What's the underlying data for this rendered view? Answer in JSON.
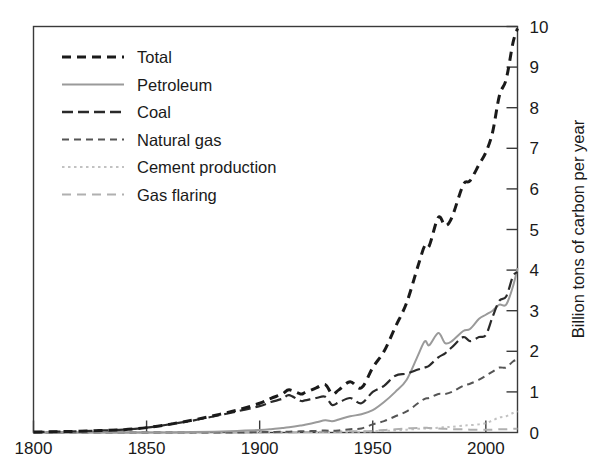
{
  "chart_data": {
    "type": "line",
    "title": "",
    "xlabel": "",
    "ylabel": "Billion tons of carbon per year",
    "xlim": [
      1800,
      2014
    ],
    "ylim": [
      0,
      10
    ],
    "xticks": [
      1800,
      1850,
      1900,
      1950,
      2000
    ],
    "xtick_labels": [
      "1800",
      "1850",
      "1900",
      "1950",
      "2000"
    ],
    "yticks": [
      0,
      1,
      2,
      3,
      4,
      5,
      6,
      7,
      8,
      9,
      10
    ],
    "ytick_labels": [
      "0",
      "1",
      "2",
      "3",
      "4",
      "5",
      "6",
      "7",
      "8",
      "9",
      "10"
    ],
    "y_axis_position": "right",
    "grid": false,
    "legend_position": "upper-left-inside",
    "x": [
      1800,
      1810,
      1820,
      1830,
      1840,
      1850,
      1860,
      1870,
      1880,
      1890,
      1900,
      1905,
      1910,
      1913,
      1918,
      1920,
      1925,
      1929,
      1932,
      1935,
      1940,
      1945,
      1950,
      1955,
      1960,
      1965,
      1970,
      1973,
      1975,
      1979,
      1982,
      1985,
      1990,
      1993,
      1997,
      2000,
      2003,
      2006,
      2009,
      2012,
      2014
    ],
    "series": [
      {
        "name": "Total",
        "color": "#1a1a1a",
        "dash": "9,6",
        "width": 3.0,
        "values": [
          0.01,
          0.02,
          0.03,
          0.05,
          0.07,
          0.12,
          0.2,
          0.3,
          0.42,
          0.55,
          0.72,
          0.84,
          0.95,
          1.05,
          0.95,
          0.98,
          1.1,
          1.18,
          0.95,
          1.05,
          1.25,
          1.1,
          1.6,
          2.0,
          2.6,
          3.2,
          4.1,
          4.6,
          4.6,
          5.3,
          5.1,
          5.3,
          6.1,
          6.2,
          6.6,
          6.9,
          7.4,
          8.3,
          8.7,
          9.6,
          9.95
        ]
      },
      {
        "name": "Petroleum",
        "color": "#9a9a9a",
        "dash": "none",
        "width": 2.0,
        "values": [
          0.0,
          0.0,
          0.0,
          0.0,
          0.0,
          0.0,
          0.0,
          0.01,
          0.02,
          0.04,
          0.06,
          0.08,
          0.11,
          0.13,
          0.17,
          0.19,
          0.25,
          0.3,
          0.28,
          0.32,
          0.4,
          0.45,
          0.55,
          0.75,
          1.0,
          1.3,
          1.9,
          2.25,
          2.15,
          2.45,
          2.2,
          2.25,
          2.5,
          2.55,
          2.8,
          2.9,
          3.0,
          3.15,
          3.15,
          3.6,
          4.05
        ]
      },
      {
        "name": "Coal",
        "color": "#2a2a2a",
        "dash": "11,5",
        "width": 2.2,
        "values": [
          0.01,
          0.02,
          0.03,
          0.05,
          0.07,
          0.12,
          0.2,
          0.29,
          0.4,
          0.52,
          0.65,
          0.75,
          0.83,
          0.92,
          0.78,
          0.79,
          0.85,
          0.88,
          0.68,
          0.74,
          0.85,
          0.72,
          1.0,
          1.15,
          1.4,
          1.45,
          1.55,
          1.6,
          1.65,
          1.85,
          1.95,
          2.1,
          2.35,
          2.25,
          2.35,
          2.4,
          2.85,
          3.25,
          3.35,
          3.85,
          3.95
        ]
      },
      {
        "name": "Natural gas",
        "color": "#555555",
        "dash": "7,5",
        "width": 2.0,
        "values": [
          0.0,
          0.0,
          0.0,
          0.0,
          0.0,
          0.0,
          0.0,
          0.0,
          0.0,
          0.0,
          0.01,
          0.01,
          0.02,
          0.02,
          0.03,
          0.03,
          0.04,
          0.05,
          0.04,
          0.05,
          0.08,
          0.1,
          0.2,
          0.28,
          0.4,
          0.52,
          0.72,
          0.83,
          0.85,
          0.95,
          0.95,
          1.0,
          1.15,
          1.2,
          1.3,
          1.4,
          1.5,
          1.6,
          1.6,
          1.75,
          1.8
        ]
      },
      {
        "name": "Cement production",
        "color": "#c2c2c2",
        "dash": "2.5,3.5",
        "width": 2.0,
        "values": [
          0.0,
          0.0,
          0.0,
          0.0,
          0.0,
          0.0,
          0.0,
          0.0,
          0.0,
          0.0,
          0.0,
          0.0,
          0.01,
          0.01,
          0.01,
          0.01,
          0.01,
          0.02,
          0.01,
          0.02,
          0.02,
          0.02,
          0.03,
          0.04,
          0.05,
          0.07,
          0.09,
          0.1,
          0.1,
          0.12,
          0.13,
          0.14,
          0.17,
          0.18,
          0.2,
          0.23,
          0.3,
          0.37,
          0.4,
          0.48,
          0.52
        ]
      },
      {
        "name": "Gas flaring",
        "color": "#b0b0b0",
        "dash": "9,6",
        "width": 2.0,
        "values": [
          0.0,
          0.0,
          0.0,
          0.0,
          0.0,
          0.0,
          0.0,
          0.0,
          0.0,
          0.0,
          0.0,
          0.0,
          0.0,
          0.0,
          0.01,
          0.01,
          0.01,
          0.02,
          0.02,
          0.02,
          0.03,
          0.03,
          0.04,
          0.06,
          0.08,
          0.1,
          0.11,
          0.12,
          0.11,
          0.1,
          0.09,
          0.08,
          0.08,
          0.07,
          0.07,
          0.07,
          0.07,
          0.08,
          0.08,
          0.09,
          0.09
        ]
      }
    ],
    "legend": [
      {
        "label": "Total",
        "color": "#1a1a1a",
        "dash": "9,6",
        "width": 3.0
      },
      {
        "label": "Petroleum",
        "color": "#9a9a9a",
        "dash": "none",
        "width": 1.8
      },
      {
        "label": "Coal",
        "color": "#2a2a2a",
        "dash": "11,5",
        "width": 2.4
      },
      {
        "label": "Natural gas",
        "color": "#555555",
        "dash": "7,5",
        "width": 2.0
      },
      {
        "label": "Cement production",
        "color": "#c2c2c2",
        "dash": "2.5,3.5",
        "width": 2.0
      },
      {
        "label": "Gas flaring",
        "color": "#b0b0b0",
        "dash": "9,6",
        "width": 2.0
      }
    ]
  }
}
